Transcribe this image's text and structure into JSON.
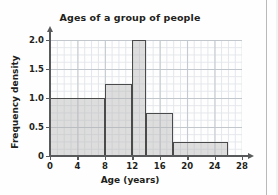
{
  "chart_data": {
    "type": "bar",
    "title": "Ages of a group of people",
    "xlabel": "Age (years)",
    "ylabel": "Frequency density",
    "xlim": [
      0,
      28
    ],
    "ylim": [
      0,
      2.1
    ],
    "xticks": [
      "0",
      "4",
      "8",
      "12",
      "16",
      "20",
      "24",
      "28"
    ],
    "xtick_values": [
      0,
      4,
      8,
      12,
      16,
      20,
      24,
      28
    ],
    "yticks": [
      "0",
      "0.5",
      "1.0",
      "1.5",
      "2.0"
    ],
    "ytick_values": [
      0,
      0.5,
      1.0,
      1.5,
      2.0
    ],
    "grid": true,
    "legend": false,
    "bar_style": {
      "fill": "#b0b0b0",
      "edge": "#4a4a4a"
    },
    "bins": [
      {
        "label": "0-8",
        "start": 0,
        "end": 8,
        "value": 1.0
      },
      {
        "label": "8-12",
        "start": 8,
        "end": 12,
        "value": 1.25
      },
      {
        "label": "12-14",
        "start": 12,
        "end": 14,
        "value": 2.0
      },
      {
        "label": "14-18",
        "start": 14,
        "end": 18,
        "value": 0.75
      },
      {
        "label": "18-26",
        "start": 18,
        "end": 26,
        "value": 0.25
      }
    ]
  }
}
